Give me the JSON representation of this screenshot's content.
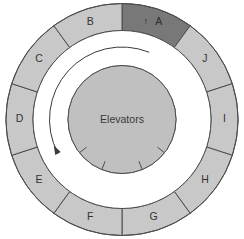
{
  "diagram": {
    "center": {
      "label": "Elevators",
      "icon": "elevator-core-icon"
    },
    "direction_arrow": {
      "icon": "counterclockwise-arrow-icon",
      "direction": "counterclockwise"
    },
    "entrance_marker": {
      "icon": "up-arrow-marker-icon",
      "glyph": "↑"
    },
    "colors": {
      "segment_fill": "#c8c8c8",
      "segment_active_fill": "#787878",
      "core_fill": "#c0c0c0",
      "corridor_fill": "#ffffff",
      "stroke": "#4d4d4d",
      "background": "#ffffff",
      "label_text": "#333333"
    },
    "geometry": {
      "cx": 122,
      "cy": 119.5,
      "outer_radius": 116,
      "ring_inner_radius": 89,
      "corridor_inner_radius": 54,
      "segment_count": 10,
      "start_angle_deg": -90
    },
    "segments": [
      {
        "id": "A",
        "label": "A",
        "active": true,
        "index": 0
      },
      {
        "id": "J",
        "label": "J",
        "active": false,
        "index": 1
      },
      {
        "id": "I",
        "label": "I",
        "active": false,
        "index": 2
      },
      {
        "id": "H",
        "label": "H",
        "active": false,
        "index": 3
      },
      {
        "id": "G",
        "label": "G",
        "active": false,
        "index": 4
      },
      {
        "id": "F",
        "label": "F",
        "active": false,
        "index": 5
      },
      {
        "id": "E",
        "label": "E",
        "active": false,
        "index": 6
      },
      {
        "id": "D",
        "label": "D",
        "active": false,
        "index": 7
      },
      {
        "id": "C",
        "label": "C",
        "active": false,
        "index": 8
      },
      {
        "id": "B",
        "label": "B",
        "active": false,
        "index": 9
      }
    ],
    "core_door_notches": 4
  }
}
